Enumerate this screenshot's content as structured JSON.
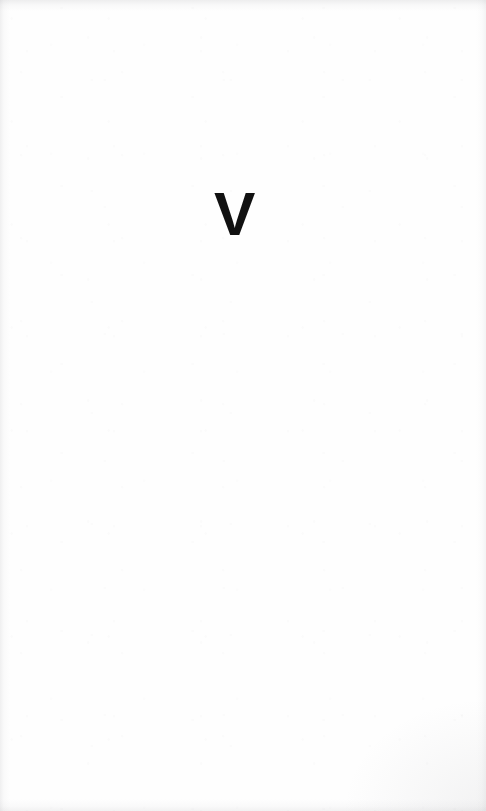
{
  "page": {
    "kind": "scanned-book-page",
    "width": 486,
    "height": 811,
    "background_color": "#fefefe",
    "ink_color": "#111111",
    "edge_tint_color": "#96969b"
  },
  "content": {
    "part_numeral": "V",
    "numeral_meaning": "roman-numeral-five",
    "body_text": "",
    "header_text": "",
    "footer_text": "",
    "page_number": ""
  }
}
